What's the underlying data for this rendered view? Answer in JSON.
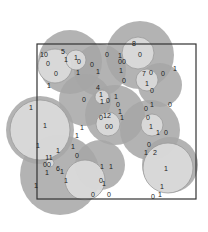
{
  "diagram": {
    "title": "",
    "frame": {
      "x": 37,
      "y": 44,
      "width": 159,
      "height": 155,
      "stroke": "#333333"
    },
    "colors": {
      "outer": "#a6a6a6",
      "inner": "#dcdcdc",
      "ring": "#9a9a9a"
    },
    "outer_circles": [
      {
        "cx": 70,
        "cy": 62,
        "r": 32
      },
      {
        "cx": 100,
        "cy": 70,
        "r": 26
      },
      {
        "cx": 140,
        "cy": 55,
        "r": 34
      },
      {
        "cx": 160,
        "cy": 85,
        "r": 22
      },
      {
        "cx": 40,
        "cy": 130,
        "r": 34
      },
      {
        "cx": 115,
        "cy": 115,
        "r": 30
      },
      {
        "cx": 85,
        "cy": 100,
        "r": 26
      },
      {
        "cx": 150,
        "cy": 130,
        "r": 30
      },
      {
        "cx": 60,
        "cy": 175,
        "r": 40
      },
      {
        "cx": 100,
        "cy": 165,
        "r": 25
      },
      {
        "cx": 170,
        "cy": 165,
        "r": 28
      }
    ],
    "inner_circles": [
      {
        "cx": 55,
        "cy": 66,
        "r": 17
      },
      {
        "cx": 76,
        "cy": 60,
        "r": 10
      },
      {
        "cx": 138,
        "cy": 53,
        "r": 16
      },
      {
        "cx": 147,
        "cy": 80,
        "r": 11
      },
      {
        "cx": 102,
        "cy": 97,
        "r": 7
      },
      {
        "cx": 108,
        "cy": 124,
        "r": 12
      },
      {
        "cx": 40,
        "cy": 130,
        "r": 30
      },
      {
        "cx": 152,
        "cy": 125,
        "r": 11
      },
      {
        "cx": 85,
        "cy": 180,
        "r": 20
      },
      {
        "cx": 50,
        "cy": 163,
        "r": 4
      },
      {
        "cx": 168,
        "cy": 168,
        "r": 25
      }
    ],
    "labels": [
      {
        "x": 44,
        "y": 54,
        "t": "10"
      },
      {
        "x": 63,
        "y": 51,
        "t": "5"
      },
      {
        "x": 48,
        "y": 63,
        "t": "0"
      },
      {
        "x": 66,
        "y": 59,
        "t": "1"
      },
      {
        "x": 76,
        "y": 57,
        "t": "1"
      },
      {
        "x": 79,
        "y": 61,
        "t": "0"
      },
      {
        "x": 56,
        "y": 73,
        "t": "0"
      },
      {
        "x": 78,
        "y": 72,
        "t": "1"
      },
      {
        "x": 92,
        "y": 64,
        "t": "0"
      },
      {
        "x": 98,
        "y": 71,
        "t": "1"
      },
      {
        "x": 49,
        "y": 85,
        "t": "1"
      },
      {
        "x": 134,
        "y": 43,
        "t": "8"
      },
      {
        "x": 107,
        "y": 54,
        "t": "0"
      },
      {
        "x": 120,
        "y": 55,
        "t": "1"
      },
      {
        "x": 122,
        "y": 61,
        "t": "00"
      },
      {
        "x": 140,
        "y": 54,
        "t": "0"
      },
      {
        "x": 121,
        "y": 70,
        "t": "1"
      },
      {
        "x": 124,
        "y": 80,
        "t": "0"
      },
      {
        "x": 151,
        "y": 72,
        "t": "0"
      },
      {
        "x": 163,
        "y": 73,
        "t": "0"
      },
      {
        "x": 175,
        "y": 68,
        "t": "1"
      },
      {
        "x": 144,
        "y": 73,
        "t": "7"
      },
      {
        "x": 147,
        "y": 83,
        "t": "1"
      },
      {
        "x": 152,
        "y": 90,
        "t": "0"
      },
      {
        "x": 98,
        "y": 87,
        "t": "4"
      },
      {
        "x": 101,
        "y": 94,
        "t": "1"
      },
      {
        "x": 102,
        "y": 101,
        "t": "1"
      },
      {
        "x": 108,
        "y": 100,
        "t": "0"
      },
      {
        "x": 84,
        "y": 99,
        "t": "0"
      },
      {
        "x": 116,
        "y": 96,
        "t": "1"
      },
      {
        "x": 118,
        "y": 104,
        "t": "0"
      },
      {
        "x": 120,
        "y": 111,
        "t": "1"
      },
      {
        "x": 101,
        "y": 117,
        "t": "0"
      },
      {
        "x": 107,
        "y": 115,
        "t": "12"
      },
      {
        "x": 109,
        "y": 126,
        "t": "00"
      },
      {
        "x": 122,
        "y": 117,
        "t": "1"
      },
      {
        "x": 146,
        "y": 108,
        "t": "0"
      },
      {
        "x": 152,
        "y": 104,
        "t": "1"
      },
      {
        "x": 170,
        "y": 104,
        "t": "0"
      },
      {
        "x": 148,
        "y": 117,
        "t": "0"
      },
      {
        "x": 151,
        "y": 126,
        "t": "1"
      },
      {
        "x": 158,
        "y": 132,
        "t": "1"
      },
      {
        "x": 166,
        "y": 132,
        "t": "0"
      },
      {
        "x": 149,
        "y": 144,
        "t": "0"
      },
      {
        "x": 146,
        "y": 152,
        "t": "1"
      },
      {
        "x": 155,
        "y": 152,
        "t": "2"
      },
      {
        "x": 166,
        "y": 168,
        "t": "1"
      },
      {
        "x": 162,
        "y": 186,
        "t": "1"
      },
      {
        "x": 160,
        "y": 194,
        "t": "1"
      },
      {
        "x": 153,
        "y": 196,
        "t": "0"
      },
      {
        "x": 31,
        "y": 107,
        "t": "1"
      },
      {
        "x": 45,
        "y": 125,
        "t": "1"
      },
      {
        "x": 38,
        "y": 145,
        "t": "1"
      },
      {
        "x": 58,
        "y": 150,
        "t": "1"
      },
      {
        "x": 82,
        "y": 127,
        "t": "1"
      },
      {
        "x": 77,
        "y": 135,
        "t": "1"
      },
      {
        "x": 77,
        "y": 155,
        "t": "0"
      },
      {
        "x": 73,
        "y": 146,
        "t": "1"
      },
      {
        "x": 49,
        "y": 157,
        "t": "11"
      },
      {
        "x": 47,
        "y": 164,
        "t": "00"
      },
      {
        "x": 47,
        "y": 172,
        "t": "1"
      },
      {
        "x": 58,
        "y": 168,
        "t": "6"
      },
      {
        "x": 62,
        "y": 171,
        "t": "1"
      },
      {
        "x": 66,
        "y": 180,
        "t": "1"
      },
      {
        "x": 36,
        "y": 185,
        "t": "1"
      },
      {
        "x": 93,
        "y": 194,
        "t": "0"
      },
      {
        "x": 101,
        "y": 180,
        "t": "0"
      },
      {
        "x": 104,
        "y": 183,
        "t": "1"
      },
      {
        "x": 109,
        "y": 194,
        "t": "0"
      },
      {
        "x": 102,
        "y": 166,
        "t": "1"
      },
      {
        "x": 111,
        "y": 166,
        "t": "1"
      }
    ]
  }
}
